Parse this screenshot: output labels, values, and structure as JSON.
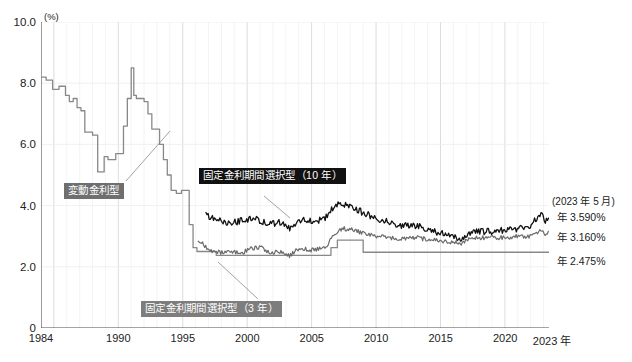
{
  "chart_data": {
    "type": "line",
    "title": "",
    "xlabel": "",
    "ylabel": "",
    "unit_label": "(%)",
    "xlim": [
      1984,
      2023.42
    ],
    "ylim": [
      0,
      10
    ],
    "yticks": [
      "0",
      "2.0",
      "4.0",
      "6.0",
      "8.0",
      "10.0"
    ],
    "ytick_values": [
      0,
      2,
      4,
      6,
      8,
      10
    ],
    "xticks": [
      "1984",
      "1990",
      "1995",
      "2000",
      "2005",
      "2010",
      "2015",
      "2020",
      "2023 年"
    ],
    "xtick_values": [
      1984,
      1990,
      1995,
      2000,
      2005,
      2010,
      2015,
      2020,
      2023.42
    ],
    "grid": "vertical yearly light, horizontal at yticks light",
    "legend_position": "inline annotation boxes",
    "series": [
      {
        "name": "変動金利型",
        "color": "#888888",
        "latest_value": 2.475,
        "latest_label": "年 2.475%",
        "x": [
          1984.0,
          1984.4,
          1984.9,
          1985.4,
          1985.9,
          1986.2,
          1986.5,
          1986.8,
          1987.1,
          1987.4,
          1987.7,
          1988.0,
          1988.4,
          1988.9,
          1989.2,
          1989.5,
          1989.8,
          1990.1,
          1990.4,
          1990.7,
          1991.0,
          1991.2,
          1991.4,
          1991.7,
          1992.0,
          1992.3,
          1992.6,
          1992.9,
          1993.2,
          1993.5,
          1993.8,
          1994.1,
          1994.5,
          1994.9,
          1995.2,
          1995.5,
          1995.8,
          1996.1,
          1996.5,
          1997.0,
          1997.6,
          1998.2,
          1998.8,
          1999.4,
          2000.0,
          2000.5,
          2001.0,
          2001.5,
          2002.0,
          2003.0,
          2004.0,
          2005.0,
          2006.0,
          2006.5,
          2007.0,
          2007.5,
          2008.0,
          2009.0,
          2009.5,
          2010.0,
          2015.0,
          2020.0,
          2023.42
        ],
        "y": [
          8.2,
          8.1,
          7.8,
          7.9,
          7.6,
          7.4,
          7.5,
          7.2,
          7.1,
          6.4,
          6.4,
          6.3,
          5.1,
          5.6,
          5.5,
          5.5,
          5.7,
          5.7,
          6.6,
          7.5,
          8.5,
          7.6,
          7.5,
          7.5,
          7.4,
          7.0,
          6.5,
          6.5,
          6.0,
          5.5,
          5.0,
          4.5,
          4.4,
          4.5,
          4.5,
          3.375,
          2.625,
          2.5,
          2.5,
          2.5,
          2.375,
          2.375,
          2.375,
          2.375,
          2.375,
          2.375,
          2.375,
          2.375,
          2.375,
          2.375,
          2.375,
          2.375,
          2.375,
          2.625,
          2.875,
          2.875,
          2.875,
          2.475,
          2.475,
          2.475,
          2.475,
          2.475,
          2.475
        ]
      },
      {
        "name": "固定金利期間選択型（10 年）",
        "color": "#111111",
        "latest_value": 3.59,
        "latest_label": "年 3.590%",
        "start_year": 1996.8
      },
      {
        "name": "固定金利期間選択型（3 年）",
        "color": "#6a6a6a",
        "latest_value": 3.16,
        "latest_label": "年 3.160%",
        "start_year": 1996.2
      }
    ],
    "annotations": [
      {
        "id": "variable-rate-label",
        "text": "変動金利型",
        "style": "gray-box"
      },
      {
        "id": "fixed10-label",
        "text": "固定金利期間選択型（10 年）",
        "style": "black-box"
      },
      {
        "id": "fixed3-label",
        "text": "固定金利期間選択型（3 年）",
        "style": "mid-gray-box"
      },
      {
        "id": "as-of-date",
        "text": "(2023 年 5 月)",
        "style": "plain"
      },
      {
        "id": "value-fixed10",
        "text": "年 3.590%",
        "style": "plain"
      },
      {
        "id": "value-fixed3",
        "text": "年 3.160%",
        "style": "plain"
      },
      {
        "id": "value-variable",
        "text": "年 2.475%",
        "style": "plain"
      }
    ]
  },
  "axis": {
    "unit": "(%)",
    "y": [
      "10.0",
      "8.0",
      "6.0",
      "4.0",
      "2.0",
      "0"
    ],
    "x": [
      "1984",
      "1990",
      "1995",
      "2000",
      "2005",
      "2010",
      "2015",
      "2020",
      "2023 年"
    ]
  },
  "labels": {
    "variable": "変動金利型",
    "fixed10": "固定金利期間選択型（10 年）",
    "fixed3": "固定金利期間選択型（3 年）"
  },
  "right_annotations": {
    "as_of": "(2023 年 5 月)",
    "fixed10_value": "年 3.590%",
    "fixed3_value": "年 3.160%",
    "variable_value": "年 2.475%"
  },
  "colors": {
    "fixed10_line": "#111111",
    "fixed3_line": "#6a6a6a",
    "variable_line": "#888888",
    "grid": "#e6e6e6",
    "axis": "#555555"
  }
}
